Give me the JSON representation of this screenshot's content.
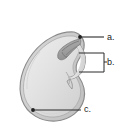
{
  "figure": {
    "name": "seed-anatomy-diagram",
    "background_color": "#ffffff",
    "labels": [
      {
        "id": "a",
        "text": "a.",
        "callout": "leader-line-with-dot"
      },
      {
        "id": "b",
        "text": "b.",
        "callout": "bracket"
      },
      {
        "id": "c",
        "text": "c.",
        "callout": "leader-line-with-dot"
      }
    ],
    "colors": {
      "outline": "#8c8c8c",
      "seed_fill_light": "#ebebeb",
      "seed_fill_mid": "#dcdcdc",
      "seed_fill_dark": "#c9c9c9",
      "embryo_fill": "#a8a8a8",
      "embryo_shade": "#8f8f8f",
      "leader_line": "#2b2b2b",
      "label_text": "#1b1b1b"
    }
  }
}
